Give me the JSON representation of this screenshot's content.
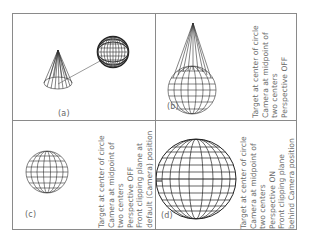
{
  "figure": {
    "panels": [
      {
        "id": "a",
        "label": "(a)",
        "caption_lines": []
      },
      {
        "id": "b",
        "label": "(b)",
        "caption_lines": [
          "Target at center of circle",
          "Camera at midpoint of",
          "two centers",
          "Perspective OFF"
        ]
      },
      {
        "id": "c",
        "label": "(c)",
        "caption_lines": [
          "Target at center of circle",
          "Camera at midpoint of",
          "two centers",
          "Perspective OFF",
          "Front clipping plane at",
          "default (Camera) position"
        ]
      },
      {
        "id": "d",
        "label": "(d)",
        "caption_lines": [
          "Target at center of circle",
          "Camera at midpoint of",
          "two centers",
          "Perspective ON",
          "Front clipping plane",
          "behind Camera position"
        ]
      }
    ],
    "colors": {
      "line": "#777777",
      "wire": "#333333",
      "text": "#6a6a6a"
    }
  }
}
